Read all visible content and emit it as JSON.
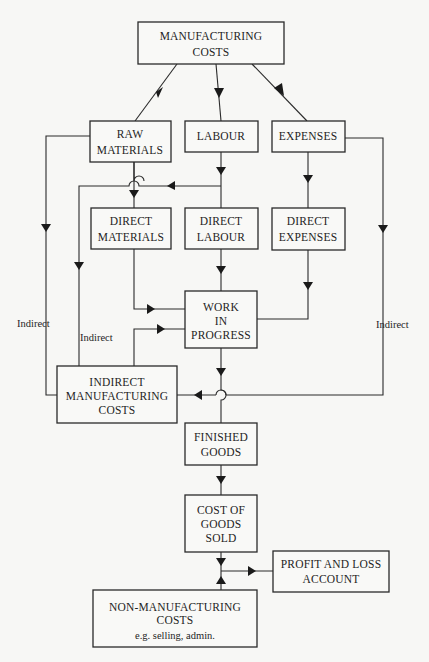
{
  "diagram": {
    "nodes": {
      "manufacturing_costs": {
        "lines": [
          "MANUFACTURING",
          "COSTS"
        ]
      },
      "raw_materials": {
        "lines": [
          "RAW",
          "MATERIALS"
        ]
      },
      "labour": {
        "lines": [
          "LABOUR"
        ]
      },
      "expenses": {
        "lines": [
          "EXPENSES"
        ]
      },
      "direct_materials": {
        "lines": [
          "DIRECT",
          "MATERIALS"
        ]
      },
      "direct_labour": {
        "lines": [
          "DIRECT",
          "LABOUR"
        ]
      },
      "direct_expenses": {
        "lines": [
          "DIRECT",
          "EXPENSES"
        ]
      },
      "work_in_progress": {
        "lines": [
          "WORK",
          "IN",
          "PROGRESS"
        ]
      },
      "indirect_manufacturing_costs": {
        "lines": [
          "INDIRECT",
          "MANUFACTURING",
          "COSTS"
        ]
      },
      "finished_goods": {
        "lines": [
          "FINISHED",
          "GOODS"
        ]
      },
      "cost_of_goods_sold": {
        "lines": [
          "COST OF",
          "GOODS",
          "SOLD"
        ]
      },
      "profit_and_loss_account": {
        "lines": [
          "PROFIT AND LOSS",
          "ACCOUNT"
        ]
      },
      "non_manufacturing_costs": {
        "lines": [
          "NON-MANUFACTURING",
          "COSTS"
        ],
        "note": "e.g. selling, admin."
      }
    },
    "edge_labels": {
      "raw_materials_indirect": "Indirect",
      "labour_indirect": "Indirect",
      "expenses_indirect": "Indirect"
    },
    "edges": [
      {
        "from": "manufacturing_costs",
        "to": "raw_materials"
      },
      {
        "from": "manufacturing_costs",
        "to": "labour"
      },
      {
        "from": "manufacturing_costs",
        "to": "expenses"
      },
      {
        "from": "raw_materials",
        "to": "direct_materials"
      },
      {
        "from": "raw_materials",
        "to": "indirect_manufacturing_costs",
        "label": "Indirect"
      },
      {
        "from": "labour",
        "to": "direct_labour"
      },
      {
        "from": "labour",
        "to": "indirect_manufacturing_costs",
        "label": "Indirect"
      },
      {
        "from": "expenses",
        "to": "direct_expenses"
      },
      {
        "from": "expenses",
        "to": "indirect_manufacturing_costs",
        "label": "Indirect"
      },
      {
        "from": "direct_materials",
        "to": "work_in_progress"
      },
      {
        "from": "direct_labour",
        "to": "work_in_progress"
      },
      {
        "from": "direct_expenses",
        "to": "work_in_progress"
      },
      {
        "from": "indirect_manufacturing_costs",
        "to": "work_in_progress"
      },
      {
        "from": "work_in_progress",
        "to": "finished_goods"
      },
      {
        "from": "finished_goods",
        "to": "cost_of_goods_sold"
      },
      {
        "from": "cost_of_goods_sold",
        "to": "profit_and_loss_account"
      },
      {
        "from": "non_manufacturing_costs",
        "to": "profit_and_loss_account"
      }
    ],
    "colors": {
      "stroke": "#2a2a2a",
      "background": "#f7f7f5",
      "text": "#1e1e1e"
    }
  }
}
